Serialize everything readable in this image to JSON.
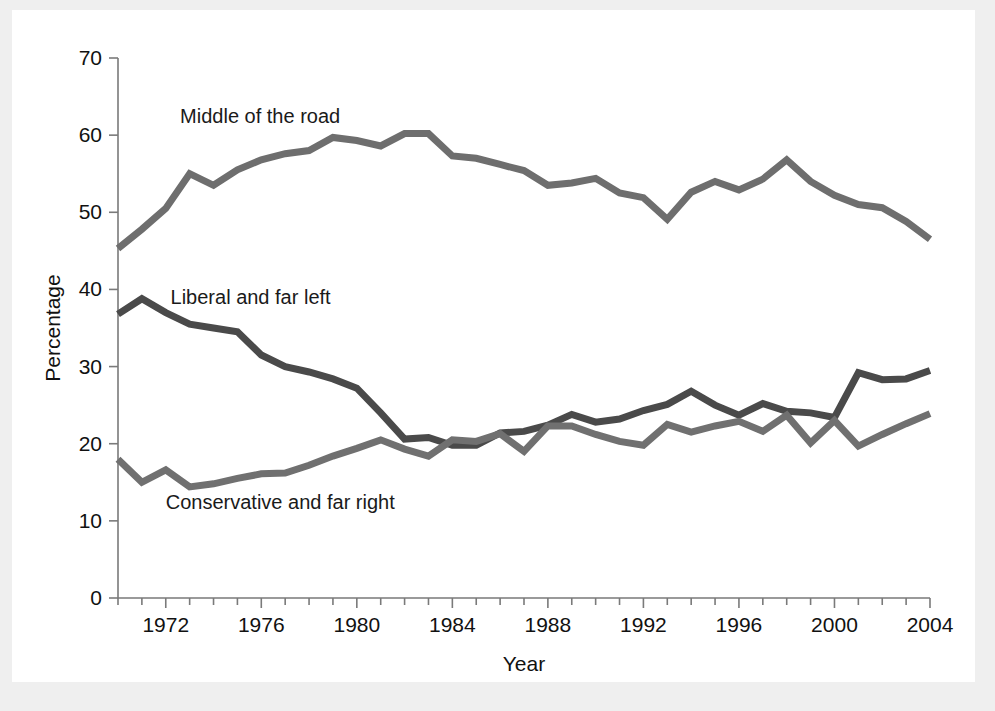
{
  "figure": {
    "background_color": "#ffffff",
    "page_background_color": "#efefef",
    "axis_color": "#7a7a7a",
    "text_color": "#111111"
  },
  "axes": {
    "x_title": "Year",
    "y_title": "Percentage",
    "x_tick_labels": [
      "1972",
      "1976",
      "1980",
      "1984",
      "1988",
      "1992",
      "1996",
      "2000",
      "2004"
    ],
    "y_tick_labels": [
      "0",
      "10",
      "20",
      "30",
      "40",
      "50",
      "60",
      "70"
    ]
  },
  "series_labels": {
    "middle": "Middle of the road",
    "liberal": "Liberal and far left",
    "conservative": "Conservative and far right"
  },
  "chart_data": {
    "type": "line",
    "title": "",
    "xlabel": "Year",
    "ylabel": "Percentage",
    "xlim": [
      1970,
      2004
    ],
    "ylim": [
      0,
      70
    ],
    "grid": false,
    "legend": "inline-labels",
    "x": [
      1970,
      1971,
      1972,
      1973,
      1974,
      1975,
      1976,
      1977,
      1978,
      1979,
      1980,
      1981,
      1982,
      1983,
      1984,
      1985,
      1986,
      1987,
      1988,
      1989,
      1990,
      1991,
      1992,
      1993,
      1994,
      1995,
      1996,
      1997,
      1998,
      1999,
      2000,
      2001,
      2002,
      2003,
      2004
    ],
    "series": [
      {
        "name": "Middle of the road",
        "color": "#6e6e6e",
        "values": [
          45.3,
          47.8,
          50.5,
          55.0,
          53.5,
          55.5,
          56.8,
          57.6,
          58.0,
          59.7,
          59.3,
          58.6,
          60.2,
          60.2,
          57.3,
          57.0,
          56.2,
          55.4,
          53.5,
          53.8,
          54.4,
          52.5,
          51.9,
          49.1,
          52.6,
          54.0,
          52.9,
          54.3,
          56.8,
          54.0,
          52.2,
          51.0,
          50.6,
          48.8,
          46.5
        ],
        "label_x": 1972.6,
        "label_y": 62.5
      },
      {
        "name": "Liberal and far left",
        "color": "#4a4a4a",
        "values": [
          36.8,
          38.8,
          37.0,
          35.5,
          35.0,
          34.5,
          31.5,
          30.0,
          29.3,
          28.4,
          27.2,
          24.0,
          20.6,
          20.8,
          19.8,
          19.8,
          21.4,
          21.6,
          22.4,
          23.8,
          22.8,
          23.2,
          24.3,
          25.1,
          26.8,
          25.0,
          23.7,
          25.2,
          24.2,
          24.0,
          23.4,
          29.2,
          28.3,
          28.4,
          29.5
        ],
        "label_x": 1972.2,
        "label_y": 39.0
      },
      {
        "name": "Conservative and far right",
        "color": "#707070",
        "values": [
          18.0,
          15.0,
          16.6,
          14.4,
          14.8,
          15.5,
          16.1,
          16.2,
          17.2,
          18.4,
          19.4,
          20.5,
          19.3,
          18.4,
          20.5,
          20.3,
          21.3,
          19.0,
          22.3,
          22.3,
          21.2,
          20.3,
          19.8,
          22.5,
          21.5,
          22.3,
          22.9,
          21.6,
          23.7,
          20.1,
          23.0,
          19.7,
          21.2,
          22.6,
          23.9
        ],
        "label_x": 1972.0,
        "label_y": 12.4
      }
    ]
  }
}
